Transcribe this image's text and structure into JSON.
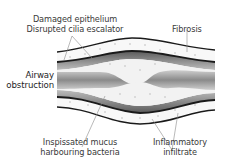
{
  "diagram": {
    "labels": {
      "damaged_epithelium": "Damaged epithelium",
      "disrupted_cilia": "Disrupted cilia escalator",
      "fibrosis": "Fibrosis",
      "airway_line1": "Airway",
      "airway_line2": "obstruction",
      "mucus_line1": "Inspissated mucus",
      "mucus_line2": "harbouring bacteria",
      "inflammatory_line1": "Inflammatory",
      "inflammatory_line2": "infiltrate"
    },
    "colors": {
      "outline": "#1a1a1a",
      "cilia_band": "#9a9a9a",
      "lumen_dark": "#8c8c8c",
      "lumen_light": "#c8c8c8",
      "mucus": "#f1f1f1",
      "wall": "#fafafa",
      "leader": "#8a8a8a",
      "text": "#3a3a3a"
    }
  }
}
